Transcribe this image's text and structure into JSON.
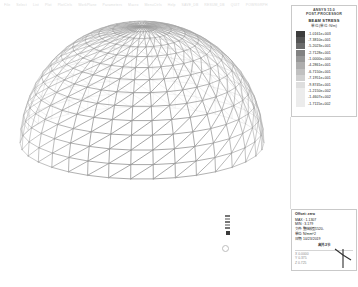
{
  "window": {
    "title": "ANSYS Post-Processor",
    "menu": [
      "File",
      "Select",
      "List",
      "Plot",
      "PlotCtrls",
      "WorkPlane",
      "Parameters",
      "Macro",
      "MenuCtrls",
      "Help"
    ],
    "toolbar": [
      "SAVE_DB",
      "RESUM_DB",
      "QUIT",
      "POWRGRPH"
    ]
  },
  "legend": {
    "line1": "ANSYS 15.0",
    "line2": "POST-PROCESSOR",
    "title": "BEAM STRESS",
    "unit": "单位(单位:N/m)",
    "swatch_colors": [
      "#3d3d3d",
      "#545454",
      "#6b6b6b",
      "#828282",
      "#989898",
      "#aeaeae",
      "#c0c0c0",
      "#d0d0d0",
      "#dedede",
      "#ececec"
    ],
    "values": [
      "-1.0161e+003",
      "-7.3810e+001",
      "-5.2023e+001",
      "-2.7128e+001",
      "-1.0000e+000",
      "-4.2861e+001",
      "-6.7150e+001",
      "-7.1951e+001",
      "-9.8745e+001",
      "-1.2150e+002",
      "-1.4607e+002",
      "-1.7115e+002"
    ]
  },
  "info": {
    "title": "Offset: zero",
    "max_label": "MAX",
    "max_value": "1.1307",
    "min_label": "MIN",
    "min_value": "3.179",
    "file_label": "文件:",
    "file_value": "整体模型1520-",
    "unit_label": "单位:",
    "unit_value": "N/mm^2",
    "date_label": "日期:",
    "date_value": "10/23/2019",
    "time_center": "高并-3节",
    "axis_lines": [
      "X  0.0000",
      "Y  0.375",
      "Z  0.725"
    ]
  },
  "viewport": {
    "pick_label": "NODE",
    "pick_value": "1"
  },
  "colors": {
    "mesh": "#b6b6b6",
    "mesh_dark": "#8f8f8f",
    "panel_border": "#c9c9c9",
    "text": "#222222"
  }
}
